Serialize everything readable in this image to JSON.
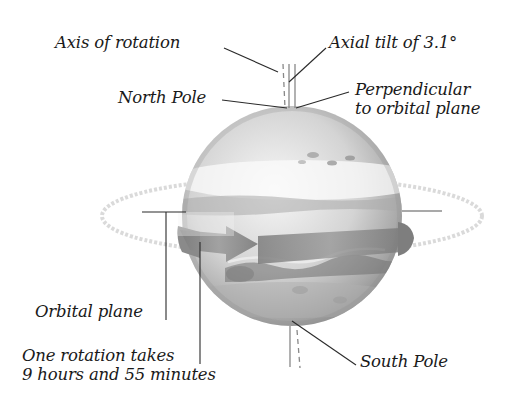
{
  "diagram": {
    "labels": {
      "axis_of_rotation": "Axis of rotation",
      "axial_tilt": "Axial tilt of 3.1°",
      "north_pole": "North Pole",
      "perpendicular_line1": "Perpendicular",
      "perpendicular_line2": "to orbital plane",
      "orbital_plane": "Orbital plane",
      "rotation_line1": "One rotation takes",
      "rotation_line2": "9 hours and 55 minutes",
      "south_pole": "South Pole"
    },
    "values": {
      "axial_tilt_degrees": 3.1,
      "rotation_period": "9 hours and 55 minutes"
    },
    "colors": {
      "text": "#1a1a1a",
      "leader_line": "#2a2a2a",
      "planet_light": "#f2f2f2",
      "planet_mid": "#bdbdbd",
      "planet_dark": "#8a8a8a",
      "arrow_band": "#8f8f8f",
      "orbit_ring": "#d6d6d6"
    }
  }
}
